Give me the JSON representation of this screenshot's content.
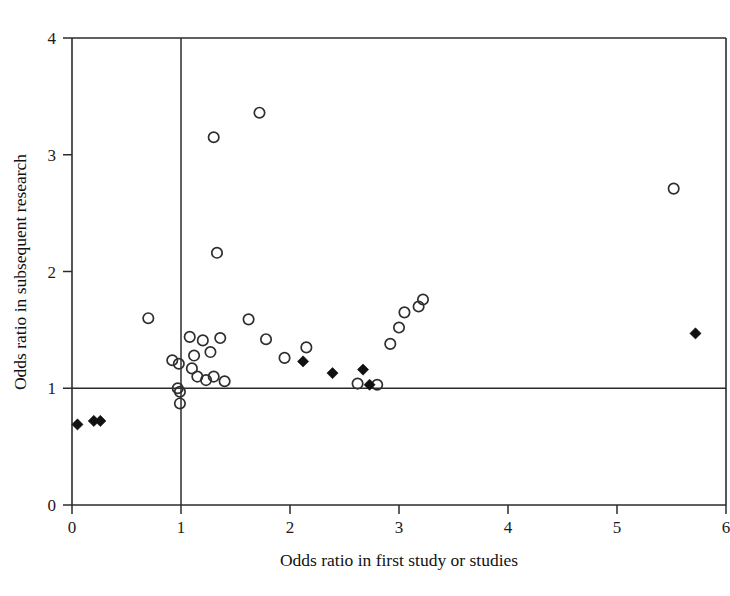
{
  "chart_data": {
    "type": "scatter",
    "title": "",
    "xlabel": "Odds ratio in first study or studies",
    "ylabel": "Odds ratio in subsequent research",
    "xlim": [
      0,
      6
    ],
    "ylim": [
      0,
      4
    ],
    "xticks": [
      0,
      1,
      2,
      3,
      4,
      5,
      6
    ],
    "yticks": [
      0,
      1,
      2,
      3,
      4
    ],
    "xtick_labels": [
      "0",
      "1",
      "2",
      "3",
      "4",
      "5",
      "6"
    ],
    "ytick_labels": [
      "0",
      "1",
      "2",
      "3",
      "4"
    ],
    "grid": false,
    "legend": null,
    "reference_lines": [
      {
        "name": "null-odds-ratio-vertical",
        "axis": "x",
        "value": 1
      },
      {
        "name": "null-odds-ratio-horizontal",
        "axis": "y",
        "value": 1
      }
    ],
    "series": [
      {
        "name": "open-circle",
        "marker": "open circle",
        "color": "#2e2e2e",
        "points": [
          [
            0.7,
            1.6
          ],
          [
            0.92,
            1.24
          ],
          [
            0.98,
            1.21
          ],
          [
            0.97,
            1.0
          ],
          [
            0.99,
            0.97
          ],
          [
            0.99,
            0.87
          ],
          [
            1.08,
            1.44
          ],
          [
            1.1,
            1.17
          ],
          [
            1.12,
            1.28
          ],
          [
            1.15,
            1.1
          ],
          [
            1.2,
            1.41
          ],
          [
            1.23,
            1.07
          ],
          [
            1.27,
            1.31
          ],
          [
            1.3,
            3.15
          ],
          [
            1.3,
            1.1
          ],
          [
            1.33,
            2.16
          ],
          [
            1.36,
            1.43
          ],
          [
            1.4,
            1.06
          ],
          [
            1.62,
            1.59
          ],
          [
            1.72,
            3.36
          ],
          [
            1.78,
            1.42
          ],
          [
            1.95,
            1.26
          ],
          [
            2.15,
            1.35
          ],
          [
            2.62,
            1.04
          ],
          [
            2.8,
            1.03
          ],
          [
            2.92,
            1.38
          ],
          [
            3.0,
            1.52
          ],
          [
            3.05,
            1.65
          ],
          [
            3.18,
            1.7
          ],
          [
            3.22,
            1.76
          ],
          [
            5.52,
            2.71
          ]
        ]
      },
      {
        "name": "filled-diamond",
        "marker": "filled diamond",
        "color": "#111111",
        "points": [
          [
            0.05,
            0.69
          ],
          [
            0.2,
            0.72
          ],
          [
            0.26,
            0.72
          ],
          [
            2.12,
            1.23
          ],
          [
            2.39,
            1.13
          ],
          [
            2.67,
            1.16
          ],
          [
            2.73,
            1.03
          ],
          [
            5.72,
            1.47
          ]
        ]
      }
    ]
  },
  "axes": {
    "x_title": "Odds ratio in first study or studies",
    "y_title": "Odds ratio in subsequent research"
  }
}
